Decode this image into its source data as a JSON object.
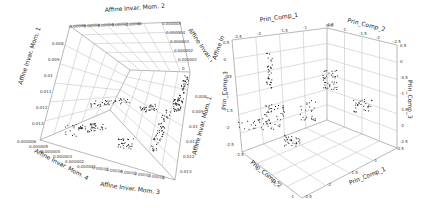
{
  "chart_data": [
    {
      "type": "scatter",
      "subtype": "3d",
      "title": "",
      "axes": {
        "x": {
          "label": "Affine Invar. Mom. 3",
          "ticks": [
            "0.00005",
            "0.00004",
            "0.00003",
            "0.00002",
            "0.00001",
            "0"
          ],
          "range": [
            0,
            5e-05
          ]
        },
        "y": {
          "label": "Affine Invar. Mom. 4",
          "ticks": [
            "0.000006",
            "0.000005",
            "0.000004",
            "0.000003",
            "0.000002",
            "0.000001",
            "0"
          ],
          "range": [
            0,
            6e-06
          ]
        },
        "z": {
          "label": "Affine Invar. Mom. 1",
          "ticks": [
            "0.008",
            "0.009",
            "0.01",
            "0.011",
            "0.012",
            "0.013"
          ],
          "range": [
            0.008,
            0.013
          ]
        }
      },
      "top_labels": {
        "x_top": [
          "-0.00005",
          "-0.00004",
          "-0.00003",
          "-0.00002",
          "-0.00001",
          "0"
        ],
        "y_top": [
          "0.000005",
          "0.000004",
          "0.000003",
          "0.000002",
          "0.000001",
          "0"
        ]
      },
      "grid": true,
      "marker_color": "#222222",
      "clusters": [
        {
          "name": "dense-vertical-right",
          "approx_x": 1e-05,
          "approx_y": 1e-06,
          "approx_z": 0.0105,
          "n": 60
        },
        {
          "name": "elongated-left",
          "approx_x": 4e-05,
          "approx_y": 5e-06,
          "approx_z": 0.0115,
          "n": 50
        },
        {
          "name": "mid-scatter",
          "approx_x": 2e-05,
          "approx_y": 3e-06,
          "approx_z": 0.0095,
          "n": 40
        },
        {
          "name": "bottom-mid",
          "approx_x": 2e-05,
          "approx_y": 2e-06,
          "approx_z": 0.012,
          "n": 30
        },
        {
          "name": "top-right-streaks",
          "approx_x": 0.0,
          "approx_y": 0.0,
          "approx_z": 0.0085,
          "n": 20
        }
      ]
    },
    {
      "type": "scatter",
      "subtype": "3d",
      "title": "",
      "axes": {
        "x": {
          "label": "Prin_Comp_1",
          "ticks": [
            "-2.5",
            "-2",
            "-1.5",
            "-1",
            "-0.5"
          ],
          "range": [
            -2.5,
            -0.5
          ]
        },
        "y": {
          "label": "Prin_Comp_2",
          "ticks": [
            "-0.5",
            "-1",
            "-1.5",
            "-2",
            "-2.5"
          ],
          "range": [
            -2.5,
            -0.5
          ]
        },
        "z": {
          "label": "Prin_Comp_3",
          "ticks": [
            "-2.5",
            "-2",
            "-1.5",
            "-1",
            "-0.5",
            "0",
            "0.5"
          ],
          "range": [
            -2.5,
            0.5
          ]
        }
      },
      "bottom_labels": {
        "x_bottom_label": "Prin_Comp_1",
        "y_bottom_label": "Prin_Comp_2"
      },
      "grid": true,
      "marker_color": "#222222",
      "clusters": [
        {
          "name": "vertical-column",
          "approx_x": -1.2,
          "approx_y": -2.2,
          "approx_z": 0.0,
          "n": 35
        },
        {
          "name": "corner-cloud",
          "approx_x": -0.6,
          "approx_y": -0.6,
          "approx_z": -0.5,
          "n": 40
        },
        {
          "name": "right-wall-cluster",
          "approx_x": -0.5,
          "approx_y": -1.2,
          "approx_z": -1.0,
          "n": 25
        },
        {
          "name": "dense-streaks-bottom",
          "approx_x": -1.8,
          "approx_y": -1.8,
          "approx_z": -2.0,
          "n": 30
        },
        {
          "name": "left-scatter",
          "approx_x": -2.2,
          "approx_y": -1.5,
          "approx_z": -1.5,
          "n": 40
        }
      ]
    }
  ],
  "left": {
    "labels": {
      "top_axis": "Affine Invar. Mom. 2",
      "left_axis": "Affine Invar. Mom. 1",
      "right_top_axis": "Affine Invar. Mom.",
      "right_axis": "Affine Invar. Mom. 1",
      "bottom_left_axis": "Affine Invar. Mom. 4",
      "bottom_axis": "Affine Invar. Mom. 3"
    },
    "ticks": {
      "top": [
        "-0.00005",
        "-0.00004",
        "-0.00003",
        "-0.00002",
        "-0.00001",
        "0"
      ],
      "top_right": [
        "0.000005",
        "0.000004",
        "0.000003",
        "0.000002",
        "0.000001",
        "0"
      ],
      "left": [
        "0.008",
        "0.009",
        "0.01",
        "0.011",
        "0.012",
        "0.013"
      ],
      "right": [
        "0.008",
        "0.009",
        "0.01",
        "0.011",
        "0.012",
        "0.013"
      ],
      "bottom_left": [
        "0.000006",
        "0.000005",
        "0.000004",
        "0.000003",
        "0.000002",
        "0.000001"
      ],
      "bottom": [
        "0.00005",
        "0.00004",
        "0.00003",
        "0.00002",
        "0.00001",
        "0"
      ]
    }
  },
  "right": {
    "labels": {
      "top_left_axis": "Prin_Comp_1",
      "top_right_axis": "Prin_Comp_2",
      "left_axis": "Prin_Comp_3",
      "right_axis": "Prin_Comp_3",
      "bottom_left_axis": "Prin_Comp_2",
      "bottom_right_axis": "Prin_Comp_1",
      "side_partial": "Affine In"
    },
    "ticks": {
      "top_left": [
        "-2.5",
        "-2",
        "-1.5",
        "-1",
        "-0.5"
      ],
      "top_right": [
        "-0.5",
        "-1",
        "-1.5",
        "-2",
        "-2.5"
      ],
      "left": [
        "0.5",
        "0",
        "-0.5",
        "-1",
        "-1.5",
        "-2",
        "-2.5"
      ],
      "right": [
        "0.5",
        "0",
        "-0.5",
        "-1",
        "-1.5",
        "-2",
        "-2.5"
      ],
      "bottom_left": [
        "-2.5",
        "-2",
        "-1.5",
        "-1"
      ],
      "bottom_right": [
        "-2.5",
        "-2",
        "-1.5",
        "-1",
        "-0.5"
      ]
    }
  }
}
